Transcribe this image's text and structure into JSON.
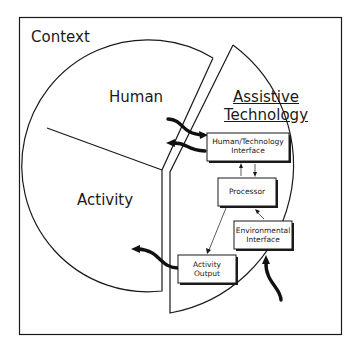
{
  "diagram": {
    "context_label": "Context",
    "sectors": {
      "human": "Human",
      "activity": "Activity",
      "assistive_technology": [
        "Assistive",
        "Technology"
      ]
    },
    "components": {
      "hti": [
        "Human/Technology",
        "Interface"
      ],
      "processor": "Processor",
      "environmental": [
        "Environmental",
        "Interface"
      ],
      "activity_output": [
        "Activity",
        "Output"
      ]
    },
    "colors": {
      "ink": "#1a1a1a",
      "background": "#ffffff"
    }
  }
}
